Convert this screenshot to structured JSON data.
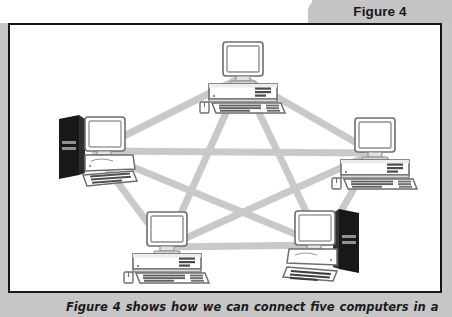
{
  "figure": {
    "tab_label": "Figure 4",
    "caption": "Figure 4 shows how we can connect five computers in a",
    "frame_border_color": "#16171a",
    "background_color": "#ffffff",
    "band_color": "#c6c6c6",
    "tab_color": "#c4c4c4"
  },
  "diagram": {
    "topology": "mesh",
    "link_color": "#c9c9c9",
    "link_width": 7,
    "node_count": 5,
    "link_count": 10,
    "nodes": [
      {
        "id": "top",
        "label": "computer-top",
        "x": 232,
        "y": 52,
        "style": "desktop-horizontal",
        "tower_side": "none"
      },
      {
        "id": "left",
        "label": "computer-left",
        "x": 84,
        "y": 126,
        "style": "tower-and-monitor",
        "tower_side": "left"
      },
      {
        "id": "right",
        "label": "computer-right",
        "x": 364,
        "y": 128,
        "style": "desktop-horizontal",
        "tower_side": "none"
      },
      {
        "id": "bottom-left",
        "label": "computer-bottom-left",
        "x": 156,
        "y": 222,
        "style": "desktop-horizontal",
        "tower_side": "none"
      },
      {
        "id": "bottom-right",
        "label": "computer-bottom-right",
        "x": 312,
        "y": 220,
        "style": "tower-and-monitor",
        "tower_side": "right"
      }
    ],
    "links": [
      {
        "from": "top",
        "to": "left"
      },
      {
        "from": "top",
        "to": "right"
      },
      {
        "from": "top",
        "to": "bottom-left"
      },
      {
        "from": "top",
        "to": "bottom-right"
      },
      {
        "from": "left",
        "to": "right"
      },
      {
        "from": "left",
        "to": "bottom-left"
      },
      {
        "from": "left",
        "to": "bottom-right"
      },
      {
        "from": "right",
        "to": "bottom-left"
      },
      {
        "from": "right",
        "to": "bottom-right"
      },
      {
        "from": "bottom-left",
        "to": "bottom-right"
      }
    ]
  }
}
